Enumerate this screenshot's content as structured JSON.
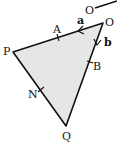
{
  "diagram": {
    "type": "vector-geometry-triangle",
    "fill_color": "#e6e6e6",
    "stroke_color": "#111111",
    "vertices": {
      "O": {
        "label": "O",
        "x": 103,
        "y": 23
      },
      "P": {
        "label": "P",
        "x": 13,
        "y": 52
      },
      "Q": {
        "label": "Q",
        "x": 66,
        "y": 126
      }
    },
    "points": {
      "A": {
        "label": "A",
        "on": "OP"
      },
      "B": {
        "label": "B",
        "on": "OQ"
      },
      "N": {
        "label": "N",
        "on": "PQ"
      }
    },
    "vectors": {
      "a": {
        "label": "a",
        "along": "OP"
      },
      "b": {
        "label": "b",
        "along": "OQ"
      }
    },
    "partial_label": {
      "label": "O"
    }
  }
}
